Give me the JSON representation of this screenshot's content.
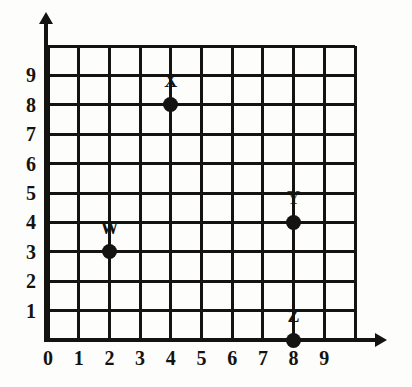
{
  "chart_data": {
    "type": "scatter",
    "title": "",
    "xlabel": "",
    "ylabel": "",
    "xlim": [
      0,
      10
    ],
    "ylim": [
      0,
      10
    ],
    "grid": true,
    "legend": "none",
    "x_ticks": [
      "0",
      "1",
      "2",
      "3",
      "4",
      "5",
      "6",
      "7",
      "8",
      "9"
    ],
    "y_ticks": [
      "1",
      "2",
      "3",
      "4",
      "5",
      "6",
      "7",
      "8",
      "9"
    ],
    "points": [
      {
        "label": "W",
        "x": 2,
        "y": 3
      },
      {
        "label": "X",
        "x": 4,
        "y": 8
      },
      {
        "label": "Y",
        "x": 8,
        "y": 4
      },
      {
        "label": "Z",
        "x": 8,
        "y": 0
      }
    ],
    "colors": {
      "point": "#15130f",
      "gridline": "#15130f",
      "axis": "#15130f",
      "background": "#fdfdfb",
      "text": "#15130f"
    }
  }
}
